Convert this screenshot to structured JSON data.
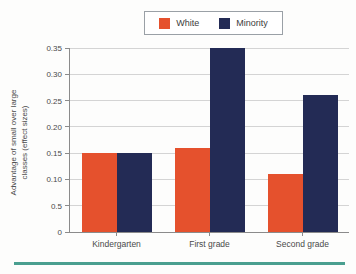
{
  "chart_data": {
    "type": "bar",
    "title": "",
    "categories": [
      "Kindergarten",
      "First grade",
      "Second grade"
    ],
    "series": [
      {
        "name": "White",
        "color": "#e5512d",
        "values": [
          0.15,
          0.16,
          0.11
        ]
      },
      {
        "name": "Minority",
        "color": "#232b55",
        "values": [
          0.15,
          0.35,
          0.26
        ]
      }
    ],
    "ylabel_lines": [
      "Advantage of small over large",
      "classes (effect sizes)"
    ],
    "xlabel": "",
    "ylim": [
      0,
      0.35
    ],
    "y_ticks": [
      {
        "value": 0.35,
        "label": "0.35"
      },
      {
        "value": 0.3,
        "label": "0.30"
      },
      {
        "value": 0.25,
        "label": "0.25"
      },
      {
        "value": 0.2,
        "label": "0.20"
      },
      {
        "value": 0.15,
        "label": "0.15"
      },
      {
        "value": 0.1,
        "label": "0.10"
      },
      {
        "value": 0.05,
        "label": "0.5"
      },
      {
        "value": 0.0,
        "label": "0"
      }
    ],
    "grid": true,
    "legend_position": "top-center"
  },
  "colors": {
    "white_series": "#e5512d",
    "minority_series": "#232b55",
    "footer_rule": "#4a9f90",
    "gridline": "#d4d4d4",
    "axis": "#8b8b8b"
  }
}
